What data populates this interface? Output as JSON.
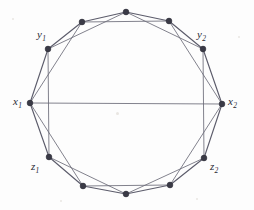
{
  "figure": {
    "background_color": "#fdfdfd",
    "edge_color": "#6b6b78",
    "vertex_color": "#3a3a46",
    "width": 254,
    "height": 210
  },
  "vertices": [
    {
      "id": "x1",
      "label": "x",
      "subscript": "1",
      "labeled": true,
      "x": 30,
      "y": 103,
      "label_x": 13,
      "label_y": 96
    },
    {
      "id": "y1",
      "label": "y",
      "subscript": "1",
      "labeled": true,
      "x": 48,
      "y": 49,
      "label_x": 37,
      "label_y": 29
    },
    {
      "id": "t1",
      "label": "",
      "subscript": "",
      "labeled": false,
      "x": 82,
      "y": 22,
      "label_x": 0,
      "label_y": 0
    },
    {
      "id": "t2",
      "label": "",
      "subscript": "",
      "labeled": false,
      "x": 126,
      "y": 12,
      "label_x": 0,
      "label_y": 0
    },
    {
      "id": "t3",
      "label": "",
      "subscript": "",
      "labeled": false,
      "x": 169,
      "y": 21,
      "label_x": 0,
      "label_y": 0
    },
    {
      "id": "y2",
      "label": "y",
      "subscript": "2",
      "labeled": true,
      "x": 203,
      "y": 49,
      "label_x": 197,
      "label_y": 29
    },
    {
      "id": "x2",
      "label": "x",
      "subscript": "2",
      "labeled": true,
      "x": 222,
      "y": 104,
      "label_x": 228,
      "label_y": 96
    },
    {
      "id": "z2",
      "label": "z",
      "subscript": "2",
      "labeled": true,
      "x": 204,
      "y": 158,
      "label_x": 210,
      "label_y": 161
    },
    {
      "id": "b3",
      "label": "",
      "subscript": "",
      "labeled": false,
      "x": 170,
      "y": 185,
      "label_x": 0,
      "label_y": 0
    },
    {
      "id": "b2",
      "label": "",
      "subscript": "",
      "labeled": false,
      "x": 126,
      "y": 194,
      "label_x": 0,
      "label_y": 0
    },
    {
      "id": "b1",
      "label": "",
      "subscript": "",
      "labeled": false,
      "x": 83,
      "y": 186,
      "label_x": 0,
      "label_y": 0
    },
    {
      "id": "z1",
      "label": "z",
      "subscript": "1",
      "labeled": true,
      "x": 49,
      "y": 157,
      "label_x": 31,
      "label_y": 161
    }
  ],
  "edges": {
    "cycle": [
      [
        "x1",
        "y1"
      ],
      [
        "y1",
        "t1"
      ],
      [
        "t1",
        "t2"
      ],
      [
        "t2",
        "t3"
      ],
      [
        "t3",
        "y2"
      ],
      [
        "y2",
        "x2"
      ],
      [
        "x2",
        "z2"
      ],
      [
        "z2",
        "b3"
      ],
      [
        "b3",
        "b2"
      ],
      [
        "b2",
        "b1"
      ],
      [
        "b1",
        "z1"
      ],
      [
        "z1",
        "x1"
      ]
    ],
    "chords_distance_2": [
      [
        "x1",
        "t1"
      ],
      [
        "y1",
        "t2"
      ],
      [
        "t1",
        "t3"
      ],
      [
        "t2",
        "y2"
      ],
      [
        "t3",
        "x2"
      ],
      [
        "y2",
        "z2"
      ],
      [
        "x2",
        "b3"
      ],
      [
        "z2",
        "b2"
      ],
      [
        "b3",
        "b1"
      ],
      [
        "b2",
        "z1"
      ],
      [
        "b1",
        "x1"
      ],
      [
        "z1",
        "y1"
      ]
    ],
    "diameters": [
      [
        "x1",
        "x2"
      ]
    ]
  },
  "labels": {
    "x1": "x₁",
    "y1": "y₁",
    "x2": "x₂",
    "y2": "y₂",
    "z1": "z₁",
    "z2": "z₂"
  }
}
